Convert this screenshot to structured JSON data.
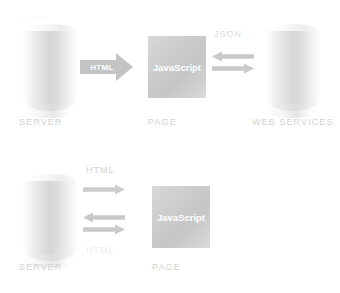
{
  "canvas": {
    "width": 340,
    "height": 293,
    "background": "#ffffff",
    "style_note": "faded light-gray technical architecture diagram"
  },
  "palette": {
    "label_gray": "#d2d2d2",
    "flow_label_gray": "#dcdcdc",
    "flow_label_pale": "#ededed",
    "arrow_gray": "#c9c9c9",
    "block_arrow_gray": "#c4c4c4",
    "page_box_gray": "#cccccc",
    "cylinder_gray": "#d6d6d6",
    "white_text": "#ffffff"
  },
  "diagrams": [
    {
      "id": "top",
      "name": "page-calls-web-services",
      "nodes": [
        {
          "id": "server",
          "type": "cylinder",
          "label": "SERVER"
        },
        {
          "id": "page",
          "type": "box",
          "label": "PAGE",
          "inner_label": "JavaScript"
        },
        {
          "id": "web-services",
          "type": "cylinder",
          "label": "WEB SERVICES"
        }
      ],
      "flows": [
        {
          "id": "server-to-page",
          "label": "HTML",
          "style": "block-arrow",
          "direction": "right",
          "label_color": "#ffffff"
        },
        {
          "id": "page-from-web-services",
          "label": "JSON",
          "style": "thin-arrow",
          "direction": "left"
        },
        {
          "id": "page-to-web-services",
          "label": "",
          "style": "thin-arrow",
          "direction": "right"
        }
      ]
    },
    {
      "id": "bottom",
      "name": "page-posts-back-to-server",
      "nodes": [
        {
          "id": "server",
          "type": "cylinder",
          "label": "SERVER"
        },
        {
          "id": "page",
          "type": "box",
          "label": "PAGE",
          "inner_label": "JavaScript"
        }
      ],
      "flows": [
        {
          "id": "server-to-page-initial",
          "label": "HTML",
          "style": "thin-arrow",
          "direction": "right"
        },
        {
          "id": "page-to-server",
          "label": "",
          "style": "thin-arrow",
          "direction": "left"
        },
        {
          "id": "server-to-page-again",
          "label": "",
          "style": "thin-arrow",
          "direction": "right"
        },
        {
          "id": "html-response",
          "label": "HTML",
          "style": "label-only",
          "direction": "none"
        }
      ]
    }
  ]
}
